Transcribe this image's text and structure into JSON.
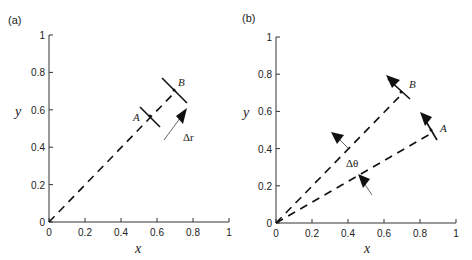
{
  "panels": [
    {
      "label": "(a)",
      "xlabel": "x",
      "ylabel": "y",
      "xticks": [
        "0",
        "0.2",
        "0.4",
        "0.6",
        "0.8",
        "1"
      ],
      "yticks": [
        "0",
        "0.2",
        "0.4",
        "0.6",
        "0.8",
        "1"
      ],
      "point_a": "A",
      "point_b": "B",
      "delta_label": "Δr"
    },
    {
      "label": "(b)",
      "xlabel": "x",
      "ylabel": "y",
      "xticks": [
        "0",
        "0.2",
        "0.4",
        "0.6",
        "0.8",
        "1"
      ],
      "yticks": [
        "0",
        "0.2",
        "0.4",
        "0.6",
        "0.8",
        "1"
      ],
      "point_a": "A",
      "point_b": "B",
      "delta_label": "Δθ"
    }
  ]
}
